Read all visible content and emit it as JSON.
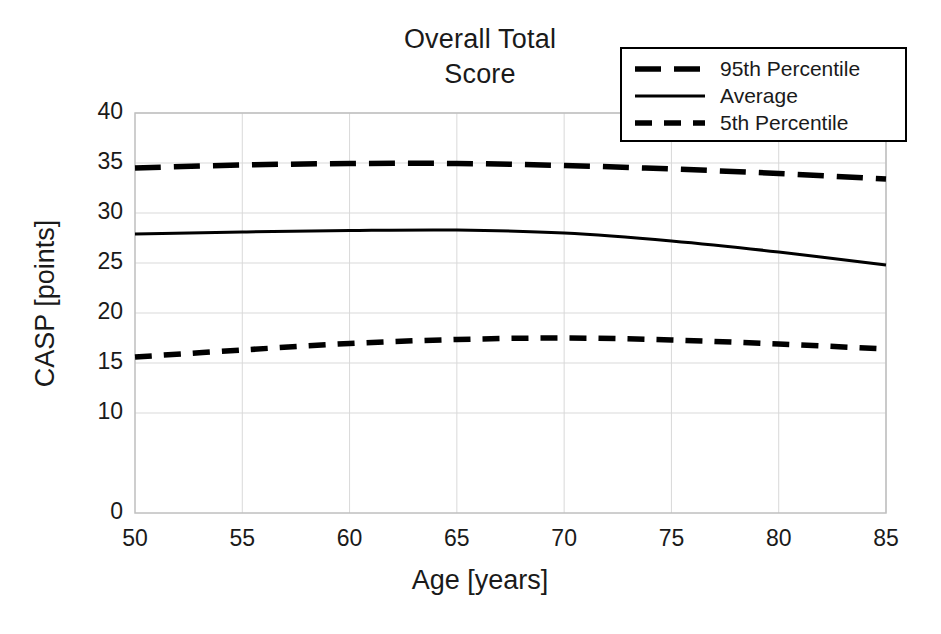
{
  "chart_data": {
    "type": "line",
    "title": "Overall Total\nScore",
    "xlabel": "Age [years]",
    "ylabel": "CASP [points]",
    "xlim": [
      50,
      85
    ],
    "ylim": [
      0,
      40
    ],
    "xticks": [
      "50",
      "55",
      "60",
      "65",
      "70",
      "75",
      "80",
      "85"
    ],
    "yticks": [
      "0",
      "10",
      "15",
      "20",
      "25",
      "30",
      "35",
      "40"
    ],
    "grid": true,
    "legend_position": "top-right",
    "x": [
      50,
      55,
      60,
      65,
      70,
      75,
      80,
      85
    ],
    "series": [
      {
        "name": "95th Percentile",
        "style": "long-dash",
        "color": "#000000",
        "values": [
          34.5,
          34.8,
          34.95,
          34.95,
          34.75,
          34.4,
          33.95,
          33.4
        ]
      },
      {
        "name": "Average",
        "style": "solid",
        "color": "#000000",
        "values": [
          27.9,
          28.1,
          28.25,
          28.3,
          28.0,
          27.2,
          26.1,
          24.8
        ]
      },
      {
        "name": "5th Percentile",
        "style": "short-dash",
        "color": "#000000",
        "values": [
          15.6,
          16.3,
          16.95,
          17.35,
          17.5,
          17.3,
          16.9,
          16.4
        ]
      }
    ]
  },
  "legend": {
    "items": [
      {
        "label": "95th Percentile",
        "style": "long-dash"
      },
      {
        "label": "Average",
        "style": "solid"
      },
      {
        "label": "5th Percentile",
        "style": "short-dash"
      }
    ]
  },
  "colors": {
    "line": "#000000",
    "grid": "#d9d9d9",
    "axis": "#bfbfbf",
    "text": "#1a1a1a",
    "background": "#ffffff"
  }
}
